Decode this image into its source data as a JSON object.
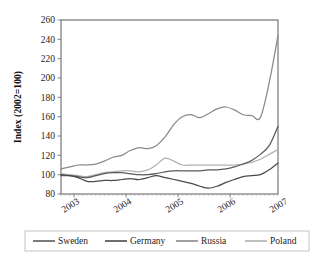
{
  "chart_data": {
    "type": "line",
    "title": "",
    "subtitle": "",
    "xlabel": "",
    "ylabel": "Index (2002=100)",
    "xlim": [
      2002.75,
      2006.92
    ],
    "ylim": [
      80,
      260
    ],
    "grid": true,
    "grid_axis": "y",
    "legend_position": "bottom",
    "y_ticks": [
      80,
      100,
      120,
      140,
      160,
      180,
      200,
      220,
      240,
      260
    ],
    "y_tick_labels": [
      "80",
      "100",
      "120",
      "140",
      "160",
      "180",
      "200",
      "220",
      "240",
      "260"
    ],
    "x_ticks": [
      2003,
      2004,
      2005,
      2006,
      2007
    ],
    "x_tick_labels": [
      "2003",
      "2004",
      "2005",
      "2006",
      "2007"
    ],
    "x": [
      2002.75,
      2002.92,
      2003.08,
      2003.25,
      2003.42,
      2003.58,
      2003.75,
      2003.92,
      2004.08,
      2004.25,
      2004.42,
      2004.58,
      2004.75,
      2004.92,
      2005.08,
      2005.25,
      2005.42,
      2005.58,
      2005.75,
      2005.92,
      2006.08,
      2006.25,
      2006.42,
      2006.58,
      2006.75,
      2006.92
    ],
    "series": [
      {
        "name": "Sweden",
        "color": "#5a5a5a",
        "values": [
          99,
          99,
          98,
          97,
          99,
          101,
          102,
          102,
          101,
          100,
          100,
          101,
          103,
          104,
          104,
          104,
          104,
          105,
          105,
          106,
          108,
          111,
          115,
          121,
          130,
          150
        ]
      },
      {
        "name": "Germany",
        "color": "#4a4a4a",
        "values": [
          100,
          99,
          97,
          93,
          93,
          94,
          94,
          95,
          96,
          95,
          97,
          99,
          97,
          95,
          93,
          91,
          88,
          86,
          88,
          92,
          95,
          98,
          99,
          100,
          105,
          112
        ]
      },
      {
        "name": "Russia",
        "color": "#8a8a8a",
        "values": [
          106,
          108,
          110,
          110,
          111,
          114,
          118,
          120,
          125,
          128,
          127,
          130,
          139,
          152,
          160,
          162,
          159,
          163,
          168,
          170,
          167,
          162,
          161,
          159,
          195,
          244
        ]
      },
      {
        "name": "Poland",
        "color": "#b0b0b0",
        "values": [
          101,
          100,
          99,
          98,
          100,
          102,
          103,
          104,
          104,
          103,
          105,
          110,
          117,
          114,
          110,
          110,
          110,
          110,
          110,
          110,
          110,
          111,
          113,
          116,
          121,
          126
        ]
      }
    ]
  },
  "legend": {
    "items": [
      {
        "label": "Sweden",
        "color": "#5a5a5a"
      },
      {
        "label": "Germany",
        "color": "#4a4a4a"
      },
      {
        "label": "Russia",
        "color": "#8a8a8a"
      },
      {
        "label": "Poland",
        "color": "#b0b0b0"
      }
    ]
  },
  "colors": {
    "background": "#ffffff",
    "frame": "#6a6a6a",
    "grid": "#d4d4d4",
    "text": "#1d1d1d"
  }
}
